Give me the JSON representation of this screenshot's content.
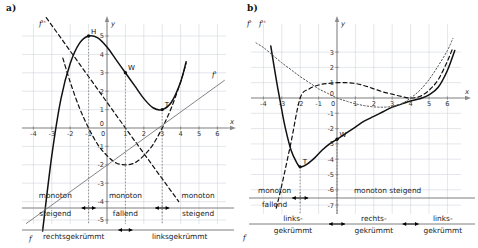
{
  "figure": {
    "panels": [
      {
        "id": "a",
        "label": "a)",
        "axes": {
          "x_name": "x",
          "y_name": "y",
          "x_ticks": [
            "-4",
            "-3",
            "-2",
            "-1",
            "0",
            "1",
            "2",
            "3",
            "4",
            "5",
            "6"
          ],
          "y_ticks": [
            "5",
            "4",
            "3",
            "2",
            "1",
            "0",
            "-1",
            "-2",
            "-3",
            "-4",
            "-5"
          ],
          "xlim": [
            -4.6,
            6.6
          ],
          "ylim": [
            -5.6,
            5.6
          ]
        },
        "curve_labels": {
          "f": "f",
          "f_prime": "f'",
          "f_double_prime": "f''"
        },
        "points": [
          {
            "name": "H",
            "label": "H",
            "x": -1,
            "y": 5
          },
          {
            "name": "W",
            "label": "W",
            "x": 1,
            "y": 3
          },
          {
            "name": "T",
            "label": "T",
            "x": 3,
            "y": 1
          }
        ],
        "monotony": {
          "segments": [
            {
              "line1": "monoton",
              "line2": "steigend"
            },
            {
              "line1": "monoton",
              "line2": "fallend"
            },
            {
              "line1": "monoton",
              "line2": "steigend"
            }
          ],
          "breaks": [
            -1,
            3
          ]
        },
        "curvature": {
          "segments": [
            {
              "text": "rechtsgekrümmt"
            },
            {
              "text": "linksgekrümmt"
            }
          ],
          "breaks": [
            1
          ]
        }
      },
      {
        "id": "b",
        "label": "b)",
        "axes": {
          "x_name": "x",
          "y_name": "y",
          "x_ticks": [
            "-4",
            "-3",
            "-2",
            "-1",
            "0",
            "1",
            "2",
            "3",
            "4",
            "5",
            "6"
          ],
          "y_ticks": [
            "3",
            "2",
            "1",
            "0",
            "-1",
            "-2",
            "-3",
            "-4",
            "-5",
            "-6",
            "-7"
          ],
          "xlim": [
            -4.6,
            6.6
          ],
          "ylim": [
            -7.4,
            3.4
          ]
        },
        "curve_labels": {
          "f": "f",
          "f_prime": "f'",
          "f_double_prime": "f''"
        },
        "points": [
          {
            "name": "T",
            "label": "T",
            "x": -2,
            "y": -4.5
          },
          {
            "name": "W",
            "label": "W",
            "x": 0,
            "y": -2.7
          }
        ],
        "monotony": {
          "segments": [
            {
              "line1": "monoton",
              "line2": "fallend"
            },
            {
              "line1": "monoton steigend",
              "line2": ""
            }
          ],
          "breaks": [
            -2
          ]
        },
        "curvature": {
          "segments": [
            {
              "line1": "links-",
              "line2": "gekrümmt"
            },
            {
              "line1": "rechts-",
              "line2": "gekrümmt"
            },
            {
              "line1": "links-",
              "line2": "gekrümmt"
            }
          ],
          "breaks": [
            0,
            4
          ]
        }
      }
    ]
  },
  "chart_data": [
    {
      "type": "line",
      "title": "a)",
      "xlabel": "x",
      "ylabel": "y",
      "xlim": [
        -4.6,
        6.6
      ],
      "ylim": [
        -5.6,
        5.6
      ],
      "grid": true,
      "legend": [
        "f",
        "f'",
        "f''"
      ],
      "annotations": [
        "H (-1|5)",
        "W (1|3)",
        "T (3|1)",
        "monoton steigend",
        "monoton fallend",
        "monoton steigend",
        "rechtsgekrümmt",
        "linksgekrümmt"
      ],
      "series": [
        {
          "name": "f",
          "style": "solid",
          "comment": "cubic through H(-1,5), W(1,3), T(3,1): f(x)=0.5x^3-1.5x^2-1.5x+4.5... normalized",
          "points_x": [
            -4.3,
            -4,
            -3.5,
            -3,
            -2.5,
            -2,
            -1.5,
            -1,
            -0.5,
            0,
            0.5,
            1,
            1.5,
            2,
            2.5,
            3,
            3.5,
            4,
            4.3
          ],
          "points_y": [
            -13.9,
            -10.5,
            -5.6,
            -1.5,
            1.6,
            3.5,
            4.6,
            5.0,
            4.9,
            4.4,
            3.7,
            3.0,
            2.3,
            1.6,
            1.1,
            1.0,
            1.4,
            2.5,
            3.6
          ]
        },
        {
          "name": "f'",
          "style": "dashed",
          "comment": "parabola with zeros at -1 and 3, minimum (1,-2)",
          "points_x": [
            -2.4,
            -2,
            -1.5,
            -1,
            -0.5,
            0,
            0.5,
            1,
            1.5,
            2,
            2.5,
            3,
            3.5,
            4,
            4.3
          ],
          "points_y": [
            3.8,
            2.5,
            1.1,
            0,
            -0.9,
            -1.5,
            -1.9,
            -2,
            -1.9,
            -1.5,
            -0.9,
            0,
            1.1,
            2.5,
            3.5
          ]
        },
        {
          "name": "f''",
          "style": "dashed-steep",
          "comment": "line through (1,0) with positive slope, drawn steeply",
          "points_x": [
            -3.3,
            1,
            3.9
          ],
          "points_y": [
            6.0,
            0,
            -4.0
          ]
        },
        {
          "name": "f'-line",
          "style": "thin",
          "comment": "thin straight ascending line (tangent/secant guide) through (-0.3,-2.4) to (6.4,2.5)",
          "points_x": [
            -4.4,
            6.4
          ],
          "points_y": [
            -5.2,
            2.6
          ]
        }
      ]
    },
    {
      "type": "line",
      "title": "b)",
      "xlabel": "x",
      "ylabel": "y",
      "xlim": [
        -4.6,
        6.6
      ],
      "ylim": [
        -7.4,
        3.4
      ],
      "grid": true,
      "legend": [
        "f",
        "f'",
        "f''"
      ],
      "annotations": [
        "T (-2|-4.5)",
        "W (0|-2.7)",
        "monoton fallend",
        "monoton steigend",
        "links-gekrümmt",
        "rechts-gekrümmt",
        "links-gekrümmt"
      ],
      "series": [
        {
          "name": "f",
          "style": "solid",
          "comment": "quartic: min T(-2,-4.5), inflection W(0,-2.7), flat near x=4 then rising",
          "points_x": [
            -3.6,
            -3.3,
            -3,
            -2.8,
            -2.5,
            -2.2,
            -2,
            -1.6,
            -1.2,
            -0.8,
            -0.4,
            0,
            0.5,
            1,
            1.5,
            2,
            2.5,
            3,
            3.5,
            4,
            4.5,
            5,
            5.5,
            6,
            6.4
          ],
          "points_y": [
            3.4,
            1.2,
            -0.8,
            -2.0,
            -3.4,
            -4.2,
            -4.5,
            -4.3,
            -3.9,
            -3.4,
            -3.0,
            -2.7,
            -2.3,
            -1.9,
            -1.5,
            -1.2,
            -0.9,
            -0.6,
            -0.4,
            -0.2,
            -0.05,
            0.2,
            0.7,
            1.8,
            3.1
          ]
        },
        {
          "name": "f'",
          "style": "dashed",
          "comment": "zero at -2 and near 4, local max (1,1)",
          "points_x": [
            -3.3,
            -3,
            -2.5,
            -2,
            -1.5,
            -1,
            -0.5,
            0,
            0.5,
            1,
            1.5,
            2,
            2.5,
            3,
            3.5,
            4,
            4.5,
            5,
            5.5,
            6,
            6.3
          ],
          "points_y": [
            -7.2,
            -5.7,
            -2.9,
            0,
            0.6,
            0.85,
            0.95,
            1.0,
            1.0,
            0.95,
            0.8,
            0.6,
            0.4,
            0.25,
            0.1,
            0.0,
            0.1,
            0.5,
            1.2,
            2.4,
            3.3
          ]
        },
        {
          "name": "f''",
          "style": "dotted",
          "comment": "zeros at 0 and 4, dotted curve high on the left",
          "points_x": [
            -4.4,
            -4,
            -3.5,
            -3,
            -2.5,
            -2,
            -1.5,
            -1,
            -0.5,
            0,
            0.5,
            1,
            1.5,
            2,
            2.5,
            3,
            3.5,
            4,
            4.5,
            5,
            5.5,
            6,
            6.3
          ],
          "points_y": [
            3.6,
            3.3,
            2.8,
            2.3,
            1.85,
            1.4,
            1.0,
            0.6,
            0.3,
            0.0,
            -0.2,
            -0.38,
            -0.5,
            -0.58,
            -0.6,
            -0.55,
            -0.38,
            0.0,
            0.5,
            1.2,
            2.1,
            3.1,
            3.9
          ]
        }
      ]
    }
  ]
}
